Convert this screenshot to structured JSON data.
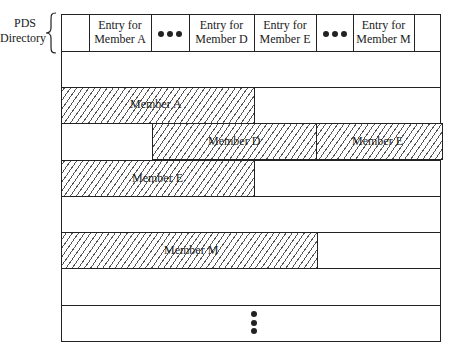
{
  "diagram": {
    "side_label": {
      "line1": "PDS",
      "line2": "Directory"
    },
    "directory_entries": [
      {
        "line1": "",
        "line2": ""
      },
      {
        "line1": "Entry for",
        "line2": "Member A"
      },
      {
        "ellipsis": true
      },
      {
        "line1": "Entry for",
        "line2": "Member D"
      },
      {
        "line1": "Entry for",
        "line2": "Member E"
      },
      {
        "ellipsis": true
      },
      {
        "line1": "Entry for",
        "line2": "Member M"
      },
      {
        "line1": "",
        "line2": ""
      }
    ],
    "members": [
      {
        "label": "Member A",
        "row": 2
      },
      {
        "label": "Member D",
        "row": 3
      },
      {
        "label": "Member E",
        "row": 3,
        "continuation": true
      },
      {
        "label": "Member E",
        "row": 4
      },
      {
        "label": "Member M",
        "row": 6
      }
    ],
    "continuation_marker": "vertical-ellipsis"
  }
}
